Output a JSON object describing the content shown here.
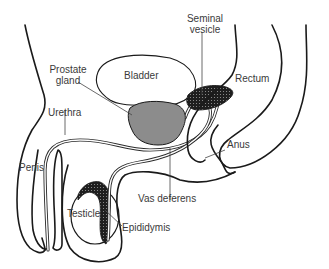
{
  "diagram": {
    "labels": {
      "seminal_vesicle": "Seminal\nvesicle",
      "seminal_vesicle_line1": "Seminal",
      "seminal_vesicle_line2": "vesicle",
      "prostate_line1": "Prostate",
      "prostate_line2": "gland",
      "bladder": "Bladder",
      "rectum": "Rectum",
      "urethra": "Urethra",
      "anus": "Anus",
      "penis": "Penis",
      "vas_deferens": "Vas deferens",
      "testicle": "Testicle",
      "epididymis": "Epididymis"
    },
    "colors": {
      "outline": "#1a1a1a",
      "prostate_fill": "#8c8c8c",
      "seminal_vesicle_fill": "#1e1e1e",
      "text": "#3a3a3a",
      "background": "#ffffff"
    }
  }
}
